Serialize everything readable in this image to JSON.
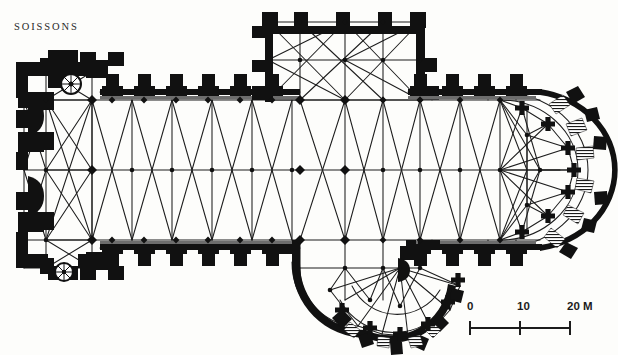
{
  "figure": {
    "title": "SOISSONS",
    "ink_color": "#111111",
    "background_color": "#fdfdfb",
    "line_color": "#1a1a1a"
  },
  "scale": {
    "units": "M",
    "tick_labels": [
      "0",
      "10",
      "20 M"
    ],
    "tick_values": [
      0,
      10,
      20
    ],
    "label_0": "0",
    "label_10": "10",
    "label_20": "20 M",
    "bar_length_px": 100,
    "meters_per_px": 0.2
  },
  "plan": {
    "orientation": "west-at-left, east-at-right",
    "parts": [
      {
        "name": "west-block",
        "label": "West front with towers"
      },
      {
        "name": "nave",
        "label": "Nave"
      },
      {
        "name": "north-aisle",
        "label": "North aisle"
      },
      {
        "name": "south-aisle",
        "label": "South aisle"
      },
      {
        "name": "north-transept",
        "label": "North transept (rectangular)"
      },
      {
        "name": "south-transept",
        "label": "South transept (apsidal)"
      },
      {
        "name": "crossing",
        "label": "Crossing"
      },
      {
        "name": "choir",
        "label": "Choir"
      },
      {
        "name": "chevet",
        "label": "Eastern apse / chevet"
      },
      {
        "name": "ambulatory",
        "label": "Ambulatory"
      },
      {
        "name": "spiral-stair-north",
        "label": "Spiral staircase"
      },
      {
        "name": "spiral-stair-south",
        "label": "Spiral staircase"
      }
    ]
  }
}
